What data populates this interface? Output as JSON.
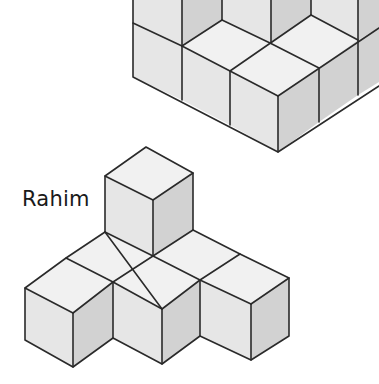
{
  "figures": {
    "top": {
      "name": ""
    },
    "bottom": {
      "name": "Rahim"
    }
  },
  "colors": {
    "background": "#ffffff",
    "top_face": "#f1f1f1",
    "left_face": "#e6e6e6",
    "right_face": "#d2d2d2",
    "edge": "#2a2a2a"
  }
}
